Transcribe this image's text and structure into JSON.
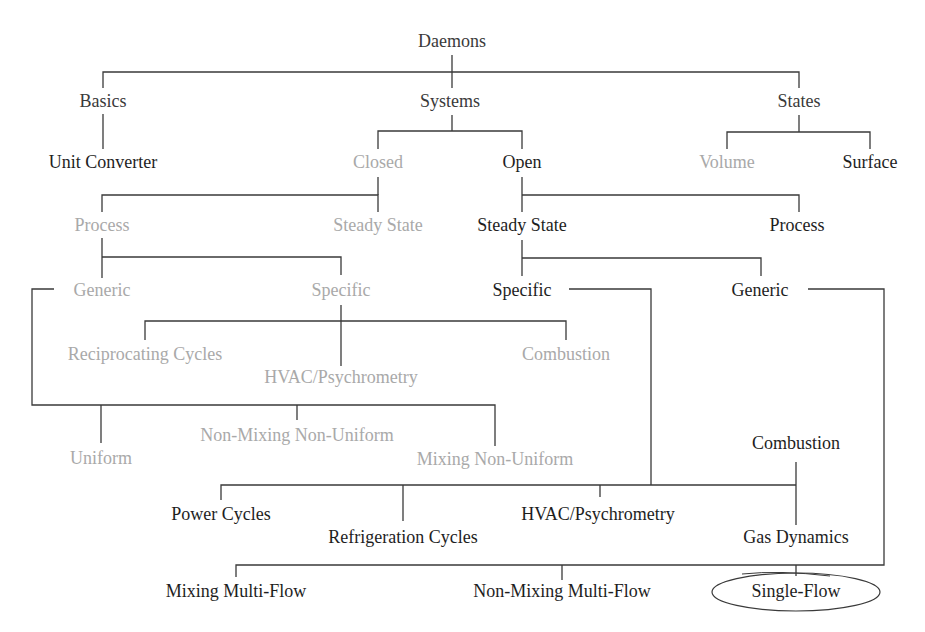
{
  "diagram": {
    "title": "Daemons",
    "colors": {
      "active": "#1e1e1e",
      "inactive": "#a9a9a9",
      "root": "#3a3a3a",
      "line": "#3a3a3a"
    },
    "nodes": {
      "daemons": "Daemons",
      "basics": "Basics",
      "systems": "Systems",
      "states": "States",
      "unit_converter": "Unit Converter",
      "closed": "Closed",
      "open": "Open",
      "volume": "Volume",
      "surface": "Surface",
      "closed_process": "Process",
      "closed_steady_state": "Steady State",
      "open_steady_state": "Steady State",
      "open_process": "Process",
      "closed_generic": "Generic",
      "closed_specific": "Specific",
      "open_specific": "Specific",
      "open_generic": "Generic",
      "closed_reciprocating_cycles": "Reciprocating Cycles",
      "closed_hvac": "HVAC/Psychrometry",
      "closed_combustion": "Combustion",
      "uniform": "Uniform",
      "non_mixing_non_uniform": "Non-Mixing Non-Uniform",
      "mixing_non_uniform": "Mixing Non-Uniform",
      "open_combustion": "Combustion",
      "power_cycles": "Power Cycles",
      "refrigeration_cycles": "Refrigeration Cycles",
      "open_hvac": "HVAC/Psychrometry",
      "gas_dynamics": "Gas Dynamics",
      "mixing_multi_flow": "Mixing Multi-Flow",
      "non_mixing_multi_flow": "Non-Mixing Multi-Flow",
      "single_flow": "Single-Flow"
    },
    "highlighted": "Single-Flow"
  }
}
